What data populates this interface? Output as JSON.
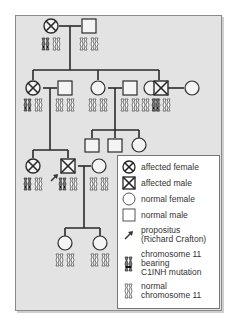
{
  "colors": {
    "panel_bg": "#e3e3e3",
    "line": "#2a2a2a",
    "symbol_fill": "#f4f4f4",
    "mutation_mark": "#333333"
  },
  "legend": {
    "items": [
      {
        "symbol": "affected-female",
        "label": "affected female"
      },
      {
        "symbol": "affected-male",
        "label": "affected male"
      },
      {
        "symbol": "normal-female",
        "label": "normal female"
      },
      {
        "symbol": "normal-male",
        "label": "normal male"
      },
      {
        "symbol": "propositus-arrow",
        "label": "propositus\n(Richard Crafton)"
      },
      {
        "symbol": "mutant-chromosome",
        "label": "chromosome 11\nbearing\nC1INH mutation"
      },
      {
        "symbol": "normal-chromosome",
        "label": "normal\nchromosome 11"
      }
    ]
  },
  "pedigree": {
    "generations": [
      {
        "id": "I",
        "members": [
          {
            "sex": "female",
            "affected": true,
            "chromosomes": "mutant+normal"
          },
          {
            "sex": "male",
            "affected": false,
            "chromosomes": "normal+normal"
          }
        ]
      },
      {
        "id": "II",
        "members": [
          {
            "sex": "female",
            "affected": true,
            "chromosomes": "mutant+normal"
          },
          {
            "sex": "male",
            "affected": false,
            "chromosomes": "normal+normal",
            "spouse_of": 0
          },
          {
            "sex": "female",
            "affected": false,
            "chromosomes": "normal+normal"
          },
          {
            "sex": "male",
            "affected": false,
            "chromosomes": "normal+normal",
            "spouse_of": 2
          },
          {
            "sex": "female",
            "affected": false,
            "chromosomes": "normal+normal"
          },
          {
            "sex": "male",
            "affected": true,
            "chromosomes": "mutant+normal"
          },
          {
            "sex": "female",
            "affected": false,
            "spouse_of": 5
          }
        ]
      },
      {
        "id": "III",
        "members": [
          {
            "sex": "female",
            "affected": true,
            "chromosomes": "mutant+normal"
          },
          {
            "sex": "male",
            "affected": true,
            "chromosomes": "mutant+normal",
            "propositus": true
          },
          {
            "sex": "female",
            "affected": false,
            "chromosomes": "normal+normal",
            "spouse_of": 1
          },
          {
            "sex": "male",
            "affected": false
          },
          {
            "sex": "male",
            "affected": false
          },
          {
            "sex": "female",
            "affected": false
          }
        ]
      },
      {
        "id": "IV",
        "members": [
          {
            "sex": "female",
            "affected": false,
            "chromosomes": "normal+normal"
          },
          {
            "sex": "female",
            "affected": false,
            "chromosomes": "normal+normal"
          }
        ]
      }
    ]
  }
}
